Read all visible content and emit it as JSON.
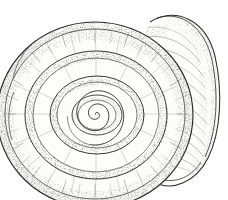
{
  "figure": {
    "common_name": "planorbid freshwater snail shell",
    "view": "apical spiral view with overlapping body whorl at right",
    "technique": "pen-and-ink stipple drawing",
    "canvas_width": 228,
    "canvas_height": 200,
    "label_text": "",
    "caption_text": "",
    "scale_bar_text": ""
  },
  "colors": {
    "background": "#ffffff",
    "ink_dark": "#2b2b2b",
    "ink_mid": "#6b6b6b",
    "ink_light": "#9a9a9a",
    "stipple_dark": "#4a4a4a",
    "stipple_mid": "#777777",
    "shell_fill": "#fdfdfc"
  },
  "geometry": {
    "spiral_center_x": 95,
    "spiral_center_y": 115,
    "outer_whorl_radius_x": 98,
    "outer_whorl_radius_y": 93,
    "whorl_count": 5,
    "body_whorl_center_x": 176,
    "body_whorl_center_y": 104,
    "body_whorl_radius_x": 44,
    "body_whorl_radius_y": 78
  },
  "chart_data": {
    "type": "scatter",
    "xlabel": "",
    "ylabel": "",
    "categories": [
      "nucleus",
      "whorl 1",
      "whorl 2",
      "whorl 3",
      "whorl 4",
      "whorl 5 (outer lip)"
    ],
    "values": [
      2,
      9,
      22,
      42,
      66,
      97
    ],
    "grid": false,
    "legend": "none"
  },
  "elements": {
    "outer_whorl_name": "outer-body-whorl",
    "inner_whorls_name": "inner-whorls",
    "nucleus_name": "shell-nucleus",
    "aperture_name": "shell-aperture",
    "growth_lines_name": "radial-growth-lines",
    "stipple_band_name": "stippled-shading-band"
  }
}
